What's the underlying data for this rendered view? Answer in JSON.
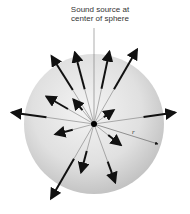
{
  "diagram": {
    "label_line1": "Sound source at",
    "label_line2": "center of sphere",
    "radius_label": "r",
    "center": [
      94,
      124
    ],
    "sphere_radius": 70,
    "colors": {
      "sphere_light": "#f2f2f2",
      "sphere_dark": "#c4c4c4",
      "arrow": "#111111",
      "ray": "#555555"
    }
  }
}
